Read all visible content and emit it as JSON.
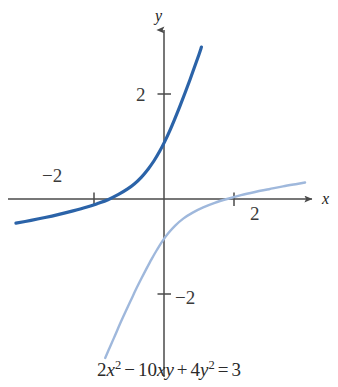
{
  "figure": {
    "caption_plain": "2x^2 - 10xy + 4y^2 = 3",
    "caption_parts": {
      "coef_x2": "2",
      "var_x": "x",
      "exp_x": "2",
      "minus": "−",
      "coef_xy": "10",
      "var_xy": "xy",
      "plus": "+",
      "coef_y2": "4",
      "var_y": "y",
      "exp_y": "2",
      "equals": "=",
      "rhs": "3"
    }
  },
  "axes": {
    "x_label": "x",
    "y_label": "y",
    "x_ticks": [
      {
        "label": "−2",
        "value": -2
      },
      {
        "label": "2",
        "value": 2
      }
    ],
    "y_ticks": [
      {
        "label": "2",
        "value": 2
      },
      {
        "label": "−2",
        "value": -2
      }
    ],
    "axis_color": "#4a4a4a",
    "origin_px": {
      "x": 164,
      "y": 199
    },
    "unit_px": 35
  },
  "colors": {
    "curve_dark": "#2b63a8",
    "curve_light": "#9fb8dc",
    "axis": "#4a4a4a",
    "text": "#2a2a2a",
    "background": "#ffffff"
  },
  "chart_data": {
    "type": "line",
    "title": "",
    "subtitle": "",
    "xlabel": "x",
    "ylabel": "y",
    "equation": "2x² − 10xy + 4y² = 3",
    "xlim": [
      -4.3,
      4.7
    ],
    "ylim": [
      -4.6,
      4.5
    ],
    "grid": false,
    "legend": null,
    "x_ticks": [
      -2,
      2
    ],
    "y_ticks": [
      -2,
      2
    ],
    "x_tick_labels": [
      "−2",
      "2"
    ],
    "y_tick_labels": [
      "−2",
      "2"
    ],
    "annotations": [],
    "series": [
      {
        "name": "upper-left branch",
        "color": "#2b63a8",
        "width": 3.2,
        "points": [
          [
            -4.23,
            -0.69
          ],
          [
            -3.8,
            -0.61
          ],
          [
            -3.4,
            -0.53
          ],
          [
            -3.0,
            -0.44
          ],
          [
            -2.6,
            -0.34
          ],
          [
            -2.2,
            -0.23
          ],
          [
            -1.9,
            -0.13
          ],
          [
            -1.6,
            -0.02
          ],
          [
            -1.3,
            0.13
          ],
          [
            -1.05,
            0.28
          ],
          [
            -0.85,
            0.43
          ],
          [
            -0.65,
            0.62
          ],
          [
            -0.45,
            0.86
          ],
          [
            -0.28,
            1.1
          ],
          [
            -0.12,
            1.37
          ],
          [
            0.02,
            1.64
          ],
          [
            0.16,
            1.94
          ],
          [
            0.3,
            2.27
          ],
          [
            0.45,
            2.64
          ],
          [
            0.6,
            3.03
          ],
          [
            0.75,
            3.43
          ],
          [
            0.9,
            3.85
          ],
          [
            1.0,
            4.13
          ],
          [
            1.07,
            4.34
          ]
        ]
      },
      {
        "name": "lower-right branch",
        "color": "#9fb8dc",
        "width": 2.4,
        "points": [
          [
            -1.68,
            -4.54
          ],
          [
            -1.55,
            -4.24
          ],
          [
            -1.4,
            -3.9
          ],
          [
            -1.25,
            -3.55
          ],
          [
            -1.1,
            -3.22
          ],
          [
            -0.95,
            -2.9
          ],
          [
            -0.8,
            -2.58
          ],
          [
            -0.65,
            -2.28
          ],
          [
            -0.5,
            -1.99
          ],
          [
            -0.35,
            -1.71
          ],
          [
            -0.2,
            -1.45
          ],
          [
            -0.05,
            -1.21
          ],
          [
            0.12,
            -0.98
          ],
          [
            0.32,
            -0.76
          ],
          [
            0.55,
            -0.56
          ],
          [
            0.82,
            -0.39
          ],
          [
            1.12,
            -0.24
          ],
          [
            1.45,
            -0.11
          ],
          [
            1.8,
            0.0
          ],
          [
            2.2,
            0.11
          ],
          [
            2.6,
            0.2
          ],
          [
            3.0,
            0.28
          ],
          [
            3.4,
            0.36
          ],
          [
            3.8,
            0.43
          ],
          [
            4.03,
            0.47
          ]
        ]
      }
    ]
  }
}
